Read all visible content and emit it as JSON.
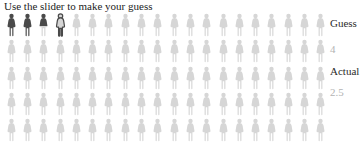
{
  "title": "Use the slider to make your guess",
  "panel": {
    "guess_label": "Guess",
    "guess_value": "4",
    "actual_label": "Actual",
    "actual_value": "2.5"
  },
  "chart_data": {
    "type": "pictograph",
    "title": "Use the slider to make your guess",
    "unit": "person-icon",
    "total_icons": 100,
    "icons_per_row": 20,
    "rows": 5,
    "guess": 4,
    "actual": 2.5,
    "encoding": {
      "guess_marker": "outlined person icon at position equal to guess",
      "actual_fill": "solid dark icons up to actual value, fractional icon filled on upper portion only",
      "remaining": "light gray icons"
    },
    "legend": [
      {
        "label": "Guess",
        "value": "4"
      },
      {
        "label": "Actual",
        "value": "2.5"
      }
    ],
    "colors": {
      "filled": "#4a4a4a",
      "empty": "#d6d6d6",
      "outline": "#4a4a4a",
      "label_text": "#2b2b2b",
      "value_text": "#b3b3b3"
    }
  }
}
